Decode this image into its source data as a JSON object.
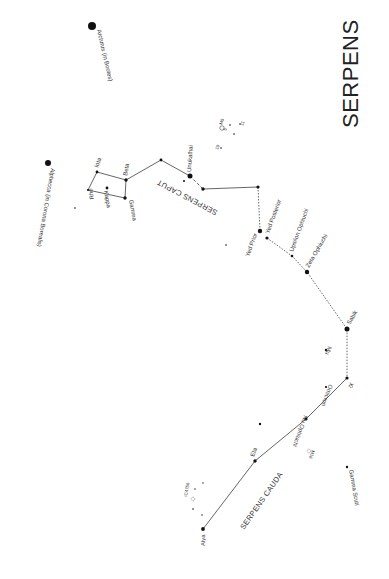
{
  "title": "SERPENS",
  "regions": {
    "caput": "SERPENS CAPUT",
    "cauda": "SERPENS CAUDA"
  },
  "stars": {
    "arcturus": {
      "label": "Arcturus (in Bootes)",
      "x": 92,
      "y": 26,
      "r": 4
    },
    "alphecca": {
      "label": "Alphecca (in Corona Borealis)",
      "x": 48,
      "y": 163,
      "r": 3
    },
    "iota": {
      "label": "Iota",
      "x": 97,
      "y": 172,
      "r": 1.4
    },
    "beta": {
      "label": "Beta",
      "x": 126,
      "y": 180,
      "r": 1.7
    },
    "rho": {
      "label": "Rho",
      "x": 88,
      "y": 190,
      "r": 1.1
    },
    "kappa": {
      "label": "Kappa",
      "x": 107,
      "y": 188,
      "r": 1.4
    },
    "gamma": {
      "label": "Gamma",
      "x": 125,
      "y": 198,
      "r": 1.7
    },
    "unukalhai": {
      "label": "Unukalhai",
      "x": 190,
      "y": 176,
      "r": 2.5
    },
    "yed_prior": {
      "label": "Yed Prior",
      "x": 260,
      "y": 231,
      "r": 2.2
    },
    "yed_posterior": {
      "label": "Yed Posterior",
      "x": 267,
      "y": 238,
      "r": 1.6
    },
    "upsilon_oph": {
      "label": "Upsilon Ophiuchi",
      "x": 292,
      "y": 256,
      "r": 1.3
    },
    "zeta_oph": {
      "label": "Zeta Ophiuchi",
      "x": 307,
      "y": 272,
      "r": 2.2
    },
    "sabik": {
      "label": "Sabik",
      "x": 347,
      "y": 329,
      "r": 2.5
    },
    "mu": {
      "label": "Mu",
      "x": 326,
      "y": 350,
      "r": 1.2
    },
    "omicron": {
      "label": "Omicron",
      "x": 326,
      "y": 387,
      "r": 1.1
    },
    "xi": {
      "label": "Xi",
      "x": 347,
      "y": 378,
      "r": 1.6
    },
    "nu_oph": {
      "label": "Nu Ophiuchi",
      "x": 306,
      "y": 419,
      "r": 1.6
    },
    "eta": {
      "label": "Eta",
      "x": 255,
      "y": 461,
      "r": 1.7
    },
    "alya": {
      "label": "Alya",
      "x": 203,
      "y": 529,
      "r": 1.9
    },
    "gamma_scuti": {
      "label": "Gamma Scuti",
      "x": 347,
      "y": 467,
      "r": 1.2
    }
  },
  "deep_sky": {
    "m5": {
      "label": "M5"
    },
    "m16": {
      "label": "M16"
    },
    "ic4756": {
      "label": "IC4756"
    },
    "n5": {
      "label": "5"
    },
    "n10": {
      "label": "10"
    },
    "n11": {
      "label": "11"
    }
  },
  "colors": {
    "background": "#ffffff",
    "ink": "#222222",
    "lines": "#555555"
  }
}
